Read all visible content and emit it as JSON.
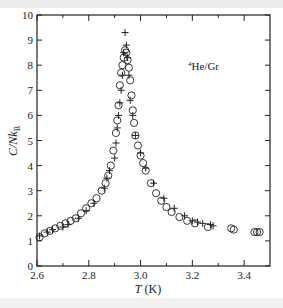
{
  "chart_data": {
    "type": "scatter",
    "title": "",
    "annotation": "4He/Gr",
    "annotation_sup": "4",
    "annotation_main": "He/Gr",
    "xlabel": "T (K)",
    "xlabel_var": "T",
    "xlabel_unit": " (K)",
    "ylabel": "C/Nk_B",
    "ylabel_main": "C/Nk",
    "ylabel_sub": "B",
    "xlim": [
      2.6,
      3.5
    ],
    "ylim": [
      0,
      10
    ],
    "xticks": [
      2.6,
      2.8,
      3.0,
      3.2,
      3.4
    ],
    "xtick_labels": [
      "2.6",
      "2.8",
      "3.0",
      "3.2",
      "3.4"
    ],
    "xminor": [
      2.7,
      2.9,
      3.1,
      3.3
    ],
    "yticks": [
      0,
      1,
      2,
      3,
      4,
      5,
      6,
      7,
      8,
      9,
      10
    ],
    "ytick_labels": [
      "0",
      "1",
      "2",
      "3",
      "4",
      "5",
      "6",
      "7",
      "8",
      "9",
      "10"
    ],
    "grid": false,
    "legend": "none",
    "series": [
      {
        "name": "circles",
        "marker": "circle",
        "x": [
          2.61,
          2.63,
          2.65,
          2.67,
          2.69,
          2.71,
          2.73,
          2.75,
          2.77,
          2.79,
          2.81,
          2.83,
          2.85,
          2.865,
          2.875,
          2.885,
          2.895,
          2.905,
          2.91,
          2.915,
          2.92,
          2.925,
          2.93,
          2.935,
          2.94,
          2.945,
          2.95,
          2.955,
          2.96,
          2.965,
          2.97,
          2.975,
          2.98,
          2.99,
          3.0,
          3.01,
          3.02,
          3.04,
          3.06,
          3.08,
          3.1,
          3.12,
          3.15,
          3.18,
          3.21,
          3.26,
          3.35,
          3.36,
          3.44,
          3.45,
          3.46
        ],
        "y": [
          1.15,
          1.3,
          1.4,
          1.5,
          1.6,
          1.7,
          1.8,
          1.9,
          2.1,
          2.3,
          2.5,
          2.7,
          3.0,
          3.3,
          3.6,
          4.0,
          4.6,
          5.3,
          5.8,
          6.4,
          7.2,
          7.7,
          8.0,
          8.3,
          8.6,
          8.5,
          8.2,
          7.9,
          7.4,
          6.8,
          6.2,
          5.7,
          5.2,
          4.8,
          4.4,
          4.1,
          3.8,
          3.3,
          2.9,
          2.6,
          2.35,
          2.15,
          1.95,
          1.8,
          1.7,
          1.55,
          1.5,
          1.45,
          1.35,
          1.35,
          1.35
        ]
      },
      {
        "name": "crosses",
        "marker": "plus",
        "x": [
          2.61,
          2.64,
          2.66,
          2.7,
          2.72,
          2.76,
          2.79,
          2.82,
          2.86,
          2.87,
          2.88,
          2.9,
          2.905,
          2.91,
          2.915,
          2.92,
          2.925,
          2.93,
          2.935,
          2.94,
          2.945,
          2.95,
          2.955,
          2.96,
          2.97,
          2.98,
          3.0,
          3.02,
          3.05,
          3.09,
          3.13,
          3.17,
          3.2,
          3.22,
          3.24,
          3.27,
          3.28
        ],
        "y": [
          1.2,
          1.35,
          1.45,
          1.55,
          1.65,
          1.9,
          2.2,
          2.5,
          3.1,
          3.5,
          3.8,
          4.3,
          4.9,
          5.5,
          6.0,
          6.5,
          7.0,
          7.6,
          8.5,
          9.3,
          8.8,
          8.3,
          7.6,
          6.6,
          6.0,
          5.2,
          4.5,
          3.9,
          3.3,
          2.7,
          2.3,
          2.0,
          1.8,
          1.75,
          1.7,
          1.65,
          1.6
        ]
      }
    ]
  }
}
